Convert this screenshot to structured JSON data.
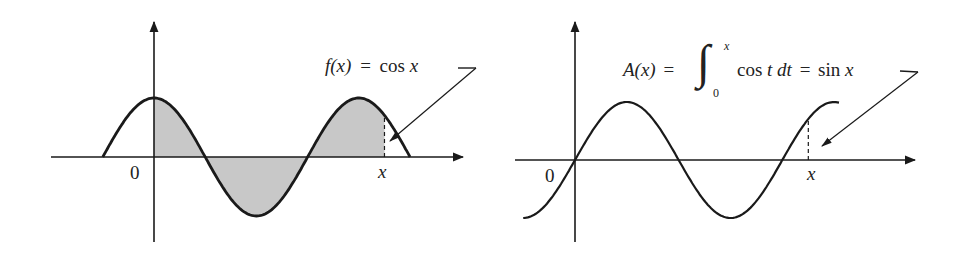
{
  "figure": {
    "left_panel": {
      "origin_label": "0",
      "x_label": "x",
      "function_label": {
        "lhs": "f(x)",
        "eq": "=",
        "rhs": "cos x"
      },
      "curve": "cos",
      "shaded_region": "area between cos curve and x-axis from 0 to x"
    },
    "right_panel": {
      "origin_label": "0",
      "x_label": "x",
      "function_label": {
        "lhs": "A(x)",
        "eq": "=",
        "integral_upper": "x",
        "integral_lower": "0",
        "integrand": "cos t dt",
        "eq2": "=",
        "rhs": "sin x"
      },
      "curve": "sin"
    },
    "colors": {
      "ink": "#1a1a1a",
      "shade": "#c8c8c8"
    }
  },
  "chart_data": [
    {
      "type": "line",
      "title": "f(x) = cos x",
      "series": [
        {
          "name": "cos x",
          "x_range": [
            -1.5708,
            7.854
          ],
          "function": "cos"
        }
      ],
      "shaded": {
        "from": 0,
        "to": 7.07
      },
      "x_marker": 7.07,
      "xlabel": "x",
      "origin": "0"
    },
    {
      "type": "line",
      "title": "A(x) = ∫₀ˣ cos t dt = sin x",
      "series": [
        {
          "name": "sin x",
          "x_range": [
            -1.5708,
            8.0
          ],
          "function": "sin"
        }
      ],
      "x_marker": 7.07,
      "xlabel": "x",
      "origin": "0"
    }
  ]
}
